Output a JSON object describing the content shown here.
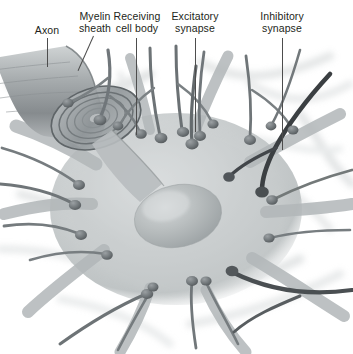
{
  "figure": {
    "style": "grayscale scientific illustration",
    "background_color": "#ffffff",
    "label_color": "#231f20",
    "leader_color": "#4d4d4d"
  },
  "labels": [
    {
      "id": "axon",
      "text": "Axon",
      "name": "label-axon"
    },
    {
      "id": "myelin",
      "text": "Myelin\nsheath",
      "name": "label-myelin-sheath"
    },
    {
      "id": "cellbody",
      "text": "Receiving\ncell body",
      "name": "label-receiving-cell-body"
    },
    {
      "id": "excitatory",
      "text": "Excitatory\nsynapse",
      "name": "label-excitatory-synapse"
    },
    {
      "id": "inhibitory",
      "text": "Inhibitory\nsynapse",
      "name": "label-inhibitory-synapse"
    }
  ],
  "structures": {
    "soma": "receiving cell body",
    "nucleus": "nucleus",
    "axon_cutaway": "myelinated axon cut away",
    "myelin_spiral": "spiral myelin wrapping",
    "dendrites": "dendrites",
    "boutons": "axon terminal boutons",
    "excitatory_fiber": "excitatory presynaptic axon",
    "inhibitory_fiber": "inhibitory presynaptic axon"
  },
  "palette": {
    "ink_dark": "#4a4f52",
    "ink_mid": "#7d8285",
    "ink_light": "#b9bdbf",
    "ink_pale": "#d8dadb",
    "soma_fill": "#c9cdce",
    "nucleus_fill": "#b3b8b9",
    "inhibitory_dark": "#3b3f42"
  }
}
